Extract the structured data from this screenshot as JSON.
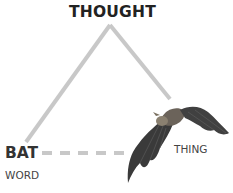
{
  "diagram": {
    "nodes": {
      "thought": "THOUGHT",
      "symbol": "BAT",
      "symbol_caption": "WORD",
      "referent": "THING"
    },
    "edges": [
      {
        "from": "symbol",
        "to": "thought",
        "style": "solid"
      },
      {
        "from": "thought",
        "to": "referent",
        "style": "solid"
      },
      {
        "from": "symbol",
        "to": "referent",
        "style": "dashed"
      }
    ],
    "image": "bat-photo",
    "colors": {
      "line": "#c8c8c8",
      "label": "#222222",
      "caption": "#444444"
    }
  }
}
